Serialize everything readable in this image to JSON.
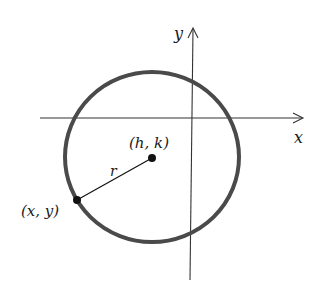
{
  "diagram": {
    "axes": {
      "x_label": "x",
      "y_label": "y"
    },
    "circle": {
      "center_label": "(h, k)",
      "radius_label": "r",
      "point_label": "(x, y)"
    },
    "colors": {
      "circle_stroke": "#4a4a4a",
      "axis_stroke": "#333333",
      "point_fill": "#111111"
    }
  }
}
